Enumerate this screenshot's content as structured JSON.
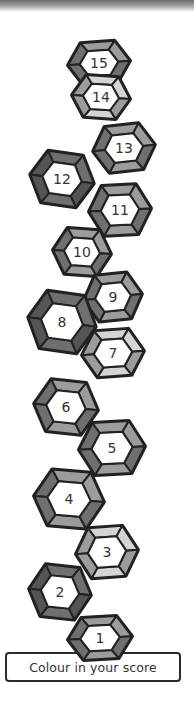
{
  "title": "Colour in your score",
  "instruction_label": "Colour in your score",
  "colors": {
    "outline": "#222222",
    "dark": "#6f6f6f",
    "medium": "#9c9c9c",
    "light": "#d4d4d4",
    "face": "#ffffff"
  },
  "gems": [
    {
      "number": "15",
      "cx": 99,
      "cy": 63,
      "w": 62,
      "h": 42,
      "rot": -4,
      "shade": "medium"
    },
    {
      "number": "14",
      "cx": 101,
      "cy": 97,
      "w": 58,
      "h": 42,
      "rot": 4,
      "shade": "light"
    },
    {
      "number": "13",
      "cx": 124,
      "cy": 148,
      "w": 62,
      "h": 46,
      "rot": -6,
      "shade": "medium"
    },
    {
      "number": "12",
      "cx": 62,
      "cy": 179,
      "w": 64,
      "h": 52,
      "rot": 8,
      "shade": "dark"
    },
    {
      "number": "11",
      "cx": 120,
      "cy": 210,
      "w": 62,
      "h": 50,
      "rot": -3,
      "shade": "medium"
    },
    {
      "number": "10",
      "cx": 82,
      "cy": 252,
      "w": 58,
      "h": 46,
      "rot": 4,
      "shade": "medium"
    },
    {
      "number": "9",
      "cx": 113,
      "cy": 297,
      "w": 58,
      "h": 46,
      "rot": -6,
      "shade": "medium"
    },
    {
      "number": "8",
      "cx": 62,
      "cy": 322,
      "w": 68,
      "h": 58,
      "rot": 8,
      "shade": "dark"
    },
    {
      "number": "7",
      "cx": 113,
      "cy": 353,
      "w": 62,
      "h": 46,
      "rot": -4,
      "shade": "light"
    },
    {
      "number": "6",
      "cx": 66,
      "cy": 407,
      "w": 64,
      "h": 52,
      "rot": 6,
      "shade": "medium"
    },
    {
      "number": "5",
      "cx": 112,
      "cy": 448,
      "w": 66,
      "h": 52,
      "rot": -3,
      "shade": "medium"
    },
    {
      "number": "4",
      "cx": 69,
      "cy": 499,
      "w": 70,
      "h": 56,
      "rot": 5,
      "shade": "medium"
    },
    {
      "number": "3",
      "cx": 107,
      "cy": 552,
      "w": 62,
      "h": 50,
      "rot": -4,
      "shade": "light"
    },
    {
      "number": "2",
      "cx": 60,
      "cy": 592,
      "w": 62,
      "h": 52,
      "rot": 6,
      "shade": "dark"
    },
    {
      "number": "1",
      "cx": 100,
      "cy": 638,
      "w": 64,
      "h": 42,
      "rot": -3,
      "shade": "medium"
    }
  ]
}
